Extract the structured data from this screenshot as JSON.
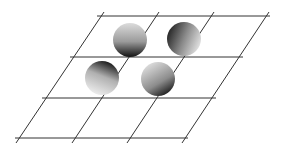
{
  "diagram": {
    "type": "skewed-grid-with-spheres",
    "background": "#ffffff",
    "line_color": "#333333",
    "grid": {
      "horizontal_lines": [
        {
          "y": 16,
          "x1": 97,
          "x2": 270
        },
        {
          "y": 57,
          "x1": 70,
          "x2": 243
        },
        {
          "y": 98,
          "x1": 42,
          "x2": 216
        },
        {
          "y": 138,
          "x1": 15,
          "x2": 188
        }
      ],
      "slanted_lines": [
        {
          "x1": 104,
          "y1": 12,
          "x2": 16,
          "y2": 143
        },
        {
          "x1": 159,
          "y1": 12,
          "x2": 72,
          "y2": 143
        },
        {
          "x1": 214,
          "y1": 12,
          "x2": 127,
          "y2": 143
        },
        {
          "x1": 269,
          "y1": 12,
          "x2": 182,
          "y2": 143
        }
      ]
    },
    "spheres": [
      {
        "id": "sphere-top-left",
        "cx": 130,
        "cy": 40,
        "r": 17,
        "shade": "dark-bottom"
      },
      {
        "id": "sphere-top-right",
        "cx": 184,
        "cy": 39,
        "r": 17,
        "shade": "dark-left"
      },
      {
        "id": "sphere-bottom-left",
        "cx": 102,
        "cy": 78,
        "r": 17,
        "shade": "dark-top"
      },
      {
        "id": "sphere-bottom-right",
        "cx": 158,
        "cy": 79,
        "r": 17,
        "shade": "dark-bottom-right"
      }
    ]
  }
}
